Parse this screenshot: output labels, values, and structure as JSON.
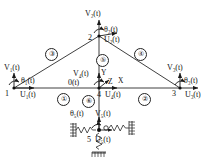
{
  "diagram": {
    "background_color": "#ffffff",
    "line_color": "#222222",
    "text_color": "#111111"
  },
  "axes": {
    "x_label": "X",
    "y_label": "Y",
    "z_label": "Z",
    "origin_label": "0(t)"
  },
  "nodes": [
    {
      "id": "node-1",
      "number": "1",
      "x": 14,
      "y": 88,
      "u_label": "U",
      "u_sub": "1",
      "v_label": "V",
      "v_sub": "1",
      "theta_label": "θ",
      "theta_sub": "1",
      "suffix": "(t)"
    },
    {
      "id": "node-2",
      "number": "2",
      "x": 99,
      "y": 36,
      "u_label": "U",
      "u_sub": "2",
      "v_label": "V",
      "v_sub": "2",
      "theta_label": "θ",
      "theta_sub": "2",
      "suffix": "(t)"
    },
    {
      "id": "node-3",
      "number": "3",
      "x": 180,
      "y": 88,
      "u_label": "U",
      "u_sub": "3",
      "v_label": "V",
      "v_sub": "3",
      "theta_label": "θ",
      "theta_sub": "3",
      "suffix": "(t)"
    },
    {
      "id": "node-4",
      "number": "4",
      "x": 99,
      "y": 88,
      "u_label": "U",
      "u_sub": "4",
      "v_label": "V",
      "v_sub": "4",
      "theta_label": "θ",
      "theta_sub": "",
      "suffix": "(t)"
    },
    {
      "id": "node-5",
      "number": "5",
      "x": 99,
      "y": 133,
      "u_label": "U",
      "u_sub": "5",
      "v_label": "V",
      "v_sub": "5",
      "theta_label": "θ",
      "theta_sub": "5",
      "suffix": "(t)"
    }
  ],
  "node_labels": {
    "n1_V": "V₁(t)",
    "n1_theta": "θ₁(t)",
    "n1_U": "U₁(t)",
    "n1_num": "1",
    "n2_V": "V₂(t)",
    "n2_theta": "θ₂(t)",
    "n2_U": "U₂(t)",
    "n2_num": "2",
    "n3_V": "V₃(t)",
    "n3_theta": "θ₃(t)",
    "n3_U": "U₃(t)",
    "n3_num": "3",
    "n4_V": "V₄(t)",
    "n4_theta": "0(t)",
    "n4_U": "U₄(t)",
    "n4_num": "4",
    "n5_V": "V₅(t)",
    "n5_theta": "θ₅(t)",
    "n5_U": "U₅(t)",
    "n5_num": "5"
  },
  "elements": [
    {
      "id": "element-1",
      "label": "①",
      "x": 57,
      "y": 93,
      "from": "node-1",
      "to": "node-4"
    },
    {
      "id": "element-2",
      "label": "②",
      "x": 138,
      "y": 93,
      "from": "node-4",
      "to": "node-3"
    },
    {
      "id": "element-3",
      "label": "③",
      "x": 48,
      "y": 51,
      "from": "node-1",
      "to": "node-2"
    },
    {
      "id": "element-4",
      "label": "④",
      "x": 137,
      "y": 51,
      "from": "node-2",
      "to": "node-3"
    },
    {
      "id": "element-5",
      "label": "⑤",
      "x": 100,
      "y": 55,
      "from": "node-2",
      "to": "node-4"
    },
    {
      "id": "element-6",
      "label": "⑥",
      "x": 84,
      "y": 95,
      "from": "node-4",
      "to": "node-5"
    }
  ],
  "supports": {
    "left_spring": "spring-left",
    "right_spring": "spring-right",
    "bottom_spring": "spring-bottom",
    "ground_hatch": "ground-support"
  }
}
